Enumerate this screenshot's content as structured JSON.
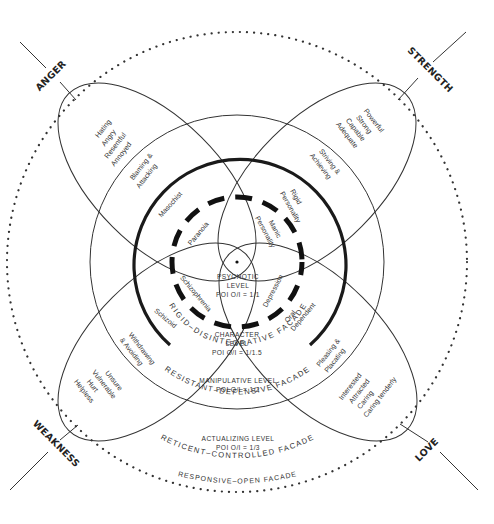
{
  "corners": {
    "anger": "ANGER",
    "strength": "STRENGTH",
    "weakness": "WEAKNESS",
    "love": "LOVE"
  },
  "petals": {
    "anger": {
      "outer": [
        "Hating",
        "Angry",
        "Resentful",
        "Annoyed"
      ],
      "middle": [
        "Blaming &",
        "Attacking"
      ],
      "inner": "Masochist",
      "core": "Paranoia"
    },
    "strength": {
      "outer": [
        "Powerful",
        "Strong",
        "Capable",
        "Adequate"
      ],
      "middle": [
        "Striving &",
        "Achieving"
      ],
      "inner": [
        "Rigid",
        "Personality"
      ],
      "core": [
        "Manic",
        "Personality"
      ]
    },
    "weakness": {
      "outer": [
        "Unsure",
        "Vulnerable",
        "Hurt",
        "Helpless"
      ],
      "middle": [
        "Withdrawing",
        "& Avoiding"
      ],
      "inner": "Schizoid",
      "core": "Schizophrenia"
    },
    "love": {
      "outer": [
        "Interested",
        "Attracted",
        "Caring",
        "Caring tenderly"
      ],
      "middle": [
        "Pleasing &",
        "Placating"
      ],
      "inner": [
        "Oral",
        "Dependent"
      ],
      "core": "Depression"
    }
  },
  "levels": {
    "psychotic": {
      "name": [
        "PSYCHOTIC",
        "LEVEL"
      ],
      "poi": "POI O/I = 1/1"
    },
    "character": {
      "name": [
        "CHARACTER",
        "LEVEL"
      ],
      "poi": "POI O/I = 1/1.5"
    },
    "manipulative": {
      "name": "MANIPULATIVE LEVEL",
      "poi": "POI O/I = 1/2"
    },
    "actualizing": {
      "name": "ACTUALIZING LEVEL",
      "poi": "POI O/I = 1/3"
    }
  },
  "facades": {
    "rigid": "RIGID–DISINTEGRATIVE FACADE",
    "resistant": "RESISTANT–DEFENSIVE FACADE",
    "reticent": "RETICENT–CONTROLLED FACADE",
    "responsive": "RESPONSIVE–OPEN FACADE"
  },
  "colors": {
    "ink": "#222222",
    "background": "#ffffff"
  }
}
